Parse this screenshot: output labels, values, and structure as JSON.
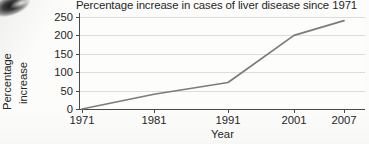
{
  "chart_data": {
    "type": "line",
    "title": "Percentage increase in cases of liver disease since 1971",
    "xlabel": "Year",
    "ylabel": "Percentage increase",
    "ylabel_lines": [
      "Percentage",
      "increase"
    ],
    "categories": [
      "1971",
      "1981",
      "1991",
      "2001",
      "2007"
    ],
    "x": [
      1971,
      1981,
      1991,
      2001,
      2007
    ],
    "values": [
      0,
      40,
      72,
      200,
      240
    ],
    "series": [
      {
        "name": "Percentage increase in cases of liver disease",
        "values": [
          0,
          40,
          72,
          200,
          240
        ]
      }
    ],
    "yticks": [
      0,
      50,
      100,
      150,
      200,
      250
    ],
    "ytick_labels": [
      "0",
      "50",
      "100",
      "150",
      "200",
      "250"
    ],
    "xtick_labels": [
      "1971",
      "1981",
      "1991",
      "2001",
      "2007"
    ],
    "ylim": [
      0,
      250
    ],
    "grid": "horizontal",
    "legend": "none",
    "line_color": "#7b7b7b",
    "gridline_color": "#dcdcdc",
    "axis_color": "#4a4a4a",
    "background_color": "#fdfdfc"
  }
}
